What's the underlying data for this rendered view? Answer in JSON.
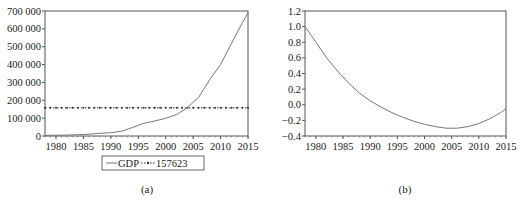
{
  "chart_data": [
    {
      "id": "a",
      "type": "line",
      "caption": "(a)",
      "title": "",
      "xlabel": "",
      "ylabel": "",
      "xlim": [
        1978,
        2015
      ],
      "ylim": [
        0,
        700000
      ],
      "x_ticks": [
        "1980",
        "1985",
        "1990",
        "1995",
        "2000",
        "2005",
        "2010",
        "2015"
      ],
      "y_ticks": [
        "0",
        "100 000",
        "200 000",
        "300 000",
        "400 000",
        "500 000",
        "600 000",
        "700 000"
      ],
      "grid": false,
      "legend": {
        "position": "bottom",
        "entries": [
          "GDP",
          "157623"
        ]
      },
      "series": [
        {
          "name": "GDP",
          "style": "solid",
          "x": [
            1978,
            1980,
            1982,
            1984,
            1986,
            1988,
            1990,
            1992,
            1994,
            1996,
            1998,
            2000,
            2002,
            2004,
            2006,
            2008,
            2010,
            2012,
            2014,
            2015
          ],
          "values": [
            3600,
            4500,
            5300,
            7200,
            10000,
            15000,
            18700,
            27000,
            48000,
            71000,
            84000,
            99000,
            120000,
            160000,
            216000,
            315000,
            400000,
            519000,
            636000,
            690000
          ]
        },
        {
          "name": "157623",
          "style": "dotted-marker",
          "x": [
            1978,
            2015
          ],
          "values": [
            157623,
            157623
          ]
        }
      ]
    },
    {
      "id": "b",
      "type": "line",
      "caption": "(b)",
      "title": "",
      "xlabel": "",
      "ylabel": "",
      "xlim": [
        1978,
        2015
      ],
      "ylim": [
        -0.4,
        1.2
      ],
      "x_ticks": [
        "1980",
        "1985",
        "1990",
        "1995",
        "2000",
        "2005",
        "2010",
        "2015"
      ],
      "y_ticks": [
        "−0.4",
        "−0.2",
        "0.0",
        "0.2",
        "0.4",
        "0.6",
        "0.8",
        "1.0",
        "1.2"
      ],
      "grid": false,
      "series": [
        {
          "name": "series",
          "x": [
            1978,
            1980,
            1982,
            1984,
            1986,
            1988,
            1990,
            1992,
            1994,
            1996,
            1998,
            2000,
            2002,
            2004,
            2006,
            2008,
            2010,
            2012,
            2014,
            2015
          ],
          "values": [
            1.0,
            0.8,
            0.6,
            0.43,
            0.28,
            0.15,
            0.05,
            -0.03,
            -0.1,
            -0.16,
            -0.21,
            -0.25,
            -0.28,
            -0.3,
            -0.3,
            -0.28,
            -0.24,
            -0.18,
            -0.1,
            -0.05
          ]
        }
      ]
    }
  ]
}
